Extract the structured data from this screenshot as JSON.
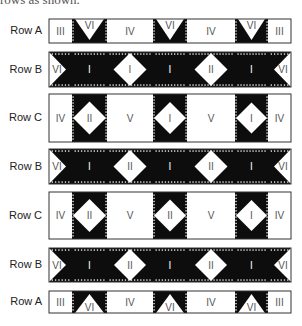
{
  "caption_fragment": "rows as shown.",
  "layout": {
    "left": 49,
    "column_widths": [
      23,
      35,
      46,
      34,
      48,
      33,
      23
    ]
  },
  "colors": {
    "dark": "#0d0d0d",
    "light": "#ffffff",
    "border": "#333333",
    "text_on_light": "#555555",
    "text_on_dark": "#ffffff"
  },
  "rows": [
    {
      "label": "Row A",
      "type": "A",
      "top": 19,
      "height": 24,
      "blocks": [
        "III",
        "VI",
        "IV",
        "VI",
        "IV",
        "VI",
        "III"
      ],
      "vi_orientation": "down"
    },
    {
      "label": "Row B",
      "type": "B",
      "top": 52,
      "height": 35,
      "blocks": [
        "VI",
        "I",
        "I",
        "I",
        "II",
        "I",
        "VI"
      ]
    },
    {
      "label": "Row C",
      "type": "C",
      "top": 94,
      "height": 48,
      "blocks": [
        "IV",
        "II",
        "V",
        "I",
        "V",
        "I",
        "IV"
      ]
    },
    {
      "label": "Row B",
      "type": "B",
      "top": 149,
      "height": 35,
      "blocks": [
        "VI",
        "I",
        "II",
        "I",
        "II",
        "I",
        "VI"
      ]
    },
    {
      "label": "Row C",
      "type": "C",
      "top": 192,
      "height": 47,
      "blocks": [
        "IV",
        "II",
        "V",
        "II",
        "V",
        "I",
        "IV"
      ]
    },
    {
      "label": "Row B",
      "type": "B",
      "top": 248,
      "height": 34,
      "blocks": [
        "VI",
        "I",
        "II",
        "I",
        "II",
        "I",
        "VI"
      ]
    },
    {
      "label": "Row A",
      "type": "A",
      "top": 291,
      "height": 22,
      "blocks": [
        "III",
        "VI",
        "IV",
        "VI",
        "IV",
        "VI",
        "III"
      ],
      "vi_orientation": "up"
    }
  ]
}
